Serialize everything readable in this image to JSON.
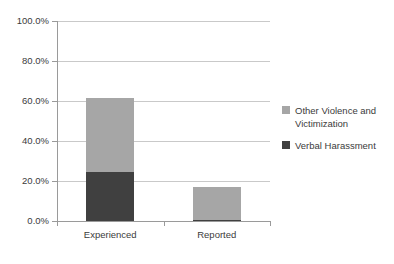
{
  "chart_data": {
    "type": "bar",
    "stacked": true,
    "title": "",
    "xlabel": "",
    "ylabel": "",
    "categories": [
      "Experienced",
      "Reported"
    ],
    "series": [
      {
        "name": "Verbal Harassment",
        "color": "#404040",
        "values": [
          24.3,
          0.5
        ]
      },
      {
        "name": "Other Violence and Victimization",
        "color": "#a6a6a6",
        "values": [
          37.2,
          16.5
        ]
      }
    ],
    "stack_order_bottom_to_top": [
      "Verbal Harassment",
      "Other Violence and Victimization"
    ],
    "totals": [
      61.5,
      17.0
    ],
    "ylim": [
      0,
      100
    ],
    "y_ticks": [
      0,
      20,
      40,
      60,
      80,
      100
    ],
    "y_tick_labels": [
      "0.0%",
      "20.0%",
      "40.0%",
      "60.0%",
      "80.0%",
      "100.0%"
    ],
    "grid": "horizontal",
    "legend_position": "right",
    "legend_entries": [
      "Other Violence and Victimization",
      "Verbal Harassment"
    ],
    "axis_color": "#9a9a9a",
    "grid_color": "#c9c9c9",
    "text_color": "#3b3b3b",
    "background": "#ffffff"
  },
  "legend": {
    "items": [
      {
        "label_line1": "Other Violence and",
        "label_line2": "Victimization",
        "swatch": "#a6a6a6"
      },
      {
        "label_line1": "Verbal Harassment",
        "label_line2": "",
        "swatch": "#404040"
      }
    ]
  }
}
